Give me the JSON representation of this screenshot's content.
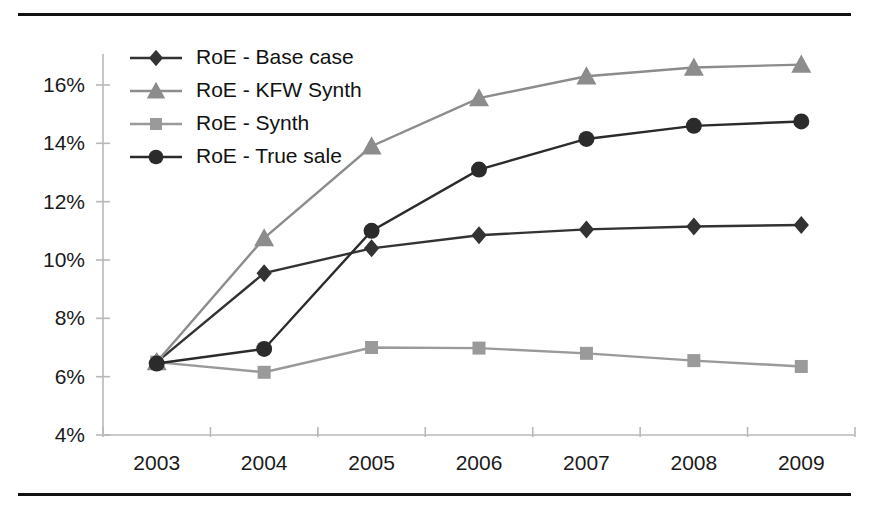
{
  "chart_data": {
    "type": "line",
    "title": "",
    "xlabel": "",
    "ylabel": "",
    "categories": [
      "2003",
      "2004",
      "2005",
      "2006",
      "2007",
      "2008",
      "2009"
    ],
    "ylim": [
      4,
      17
    ],
    "yticks": [
      4,
      6,
      8,
      10,
      12,
      14,
      16
    ],
    "ytick_labels": [
      "4%",
      "6%",
      "8%",
      "10%",
      "12%",
      "14%",
      "16%"
    ],
    "grid": false,
    "legend_position": "top-left",
    "series": [
      {
        "name": "RoE - Base case",
        "marker": "diamond",
        "color": "#333333",
        "values": [
          6.5,
          9.55,
          10.4,
          10.85,
          11.05,
          11.15,
          11.2
        ]
      },
      {
        "name": "RoE - KFW Synth",
        "marker": "triangle",
        "color": "#8c8c8c",
        "values": [
          6.5,
          10.75,
          13.9,
          15.55,
          16.3,
          16.6,
          16.7
        ]
      },
      {
        "name": "RoE - Synth",
        "marker": "square",
        "color": "#9a9a9a",
        "values": [
          6.5,
          6.15,
          7.0,
          6.98,
          6.8,
          6.55,
          6.35
        ]
      },
      {
        "name": "RoE - True sale",
        "marker": "circle",
        "color": "#2b2b2b",
        "values": [
          6.45,
          6.95,
          11.0,
          13.1,
          14.15,
          14.6,
          14.75
        ]
      }
    ]
  },
  "figure": {
    "border_color": "#111111",
    "background": "#ffffff"
  }
}
